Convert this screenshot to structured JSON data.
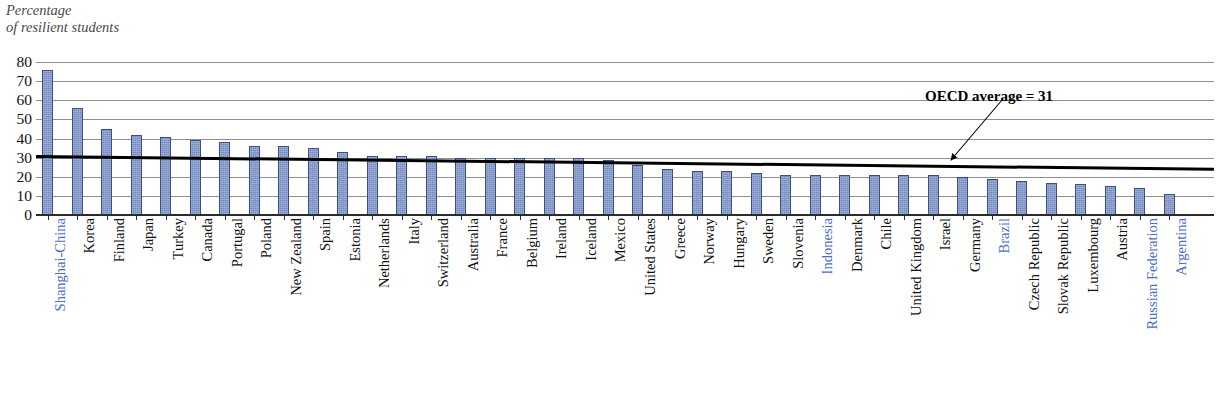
{
  "axis_title": "Percentage\nof resilient students",
  "y_ticks": [
    0,
    10,
    20,
    30,
    40,
    50,
    60,
    70,
    80
  ],
  "annotation": {
    "text": "OECD average = 31",
    "value": 31
  },
  "colors": {
    "bar_fill": "#7189c2",
    "bar_border": "#3c4f7e",
    "partner_label": "#4a6fc4",
    "oecd_label": "#111111",
    "gridline": "#8f8f8f",
    "average_line": "#000000"
  },
  "chart_data": {
    "type": "bar",
    "title": "Percentage of resilient students",
    "xlabel": "",
    "ylabel": "Percentage of resilient students",
    "ylim": [
      0,
      80
    ],
    "ytick_step": 10,
    "grid": true,
    "legend": "none",
    "orientation": "vertical",
    "sorted": "descending",
    "annotations": [
      {
        "label": "OECD average = 31",
        "type": "hline",
        "value": 31
      }
    ],
    "categories": [
      "Shanghai-China",
      "Korea",
      "Finland",
      "Japan",
      "Turkey",
      "Canada",
      "Portugal",
      "Poland",
      "New Zealand",
      "Spain",
      "Estonia",
      "Netherlands",
      "Italy",
      "Switzerland",
      "Australia",
      "France",
      "Belgium",
      "Ireland",
      "Iceland",
      "Mexico",
      "United States",
      "Greece",
      "Norway",
      "Hungary",
      "Sweden",
      "Slovenia",
      "Indonesia",
      "Denmark",
      "Chile",
      "United Kingdom",
      "Israel",
      "Germany",
      "Brazil",
      "Czech Republic",
      "Slovak Republic",
      "Luxembourg",
      "Austria",
      "Russian Federation",
      "Argentina"
    ],
    "values": [
      76,
      56,
      45,
      42,
      41,
      39,
      38,
      36,
      36,
      35,
      33,
      31,
      31,
      31,
      30,
      30,
      30,
      30,
      30,
      29,
      26,
      24,
      23,
      23,
      22,
      21,
      21,
      21,
      21,
      21,
      21,
      20,
      19,
      18,
      17,
      16,
      15,
      14,
      11
    ],
    "partner_economies": [
      "Shanghai-China",
      "Indonesia",
      "Brazil",
      "Russian Federation",
      "Argentina"
    ]
  }
}
